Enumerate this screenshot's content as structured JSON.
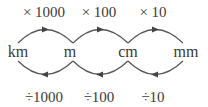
{
  "diagram": {
    "colors": {
      "text": "#3a3a3a",
      "line": "#555555",
      "arrow": "#444444",
      "background": "#ffffff"
    },
    "units": [
      {
        "label": "km",
        "x": 18
      },
      {
        "label": "m",
        "x": 70
      },
      {
        "label": "cm",
        "x": 128
      },
      {
        "label": "mm",
        "x": 186
      }
    ],
    "multiply_labels": [
      {
        "label": "× 1000",
        "x": 44
      },
      {
        "label": "× 100",
        "x": 99
      },
      {
        "label": "× 10",
        "x": 153
      }
    ],
    "divide_labels": [
      {
        "label": "÷1000",
        "x": 44
      },
      {
        "label": "÷100",
        "x": 99
      },
      {
        "label": "÷10",
        "x": 153
      }
    ]
  }
}
